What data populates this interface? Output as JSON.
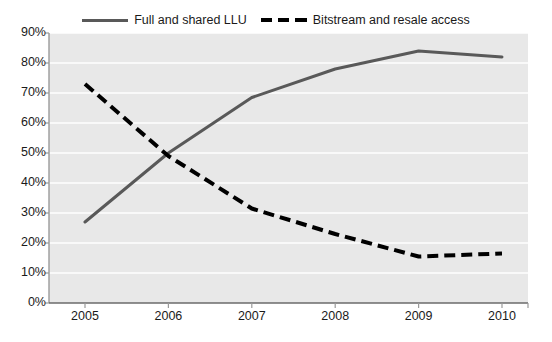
{
  "chart_data": {
    "type": "line",
    "title": "",
    "xlabel": "",
    "ylabel": "",
    "categories": [
      "2005",
      "2006",
      "2007",
      "2008",
      "2009",
      "2010"
    ],
    "x": [
      2005,
      2006,
      2007,
      2008,
      2009,
      2010
    ],
    "ylim": [
      0,
      90
    ],
    "ytick_labels": [
      "0%",
      "10%",
      "20%",
      "30%",
      "40%",
      "50%",
      "60%",
      "70%",
      "80%",
      "90%"
    ],
    "ytick_values": [
      0,
      10,
      20,
      30,
      40,
      50,
      60,
      70,
      80,
      90
    ],
    "grid": "horizontal",
    "legend_position": "top-center",
    "plot_background": "#e8e8e8",
    "series": [
      {
        "name": "Full and shared LLU",
        "values": [
          27,
          50,
          68.5,
          78,
          84,
          82
        ],
        "color": "#595959",
        "style": "solid"
      },
      {
        "name": "Bitstream and resale access",
        "values": [
          73,
          49,
          31.5,
          23,
          15.5,
          16.5
        ],
        "color": "#000000",
        "style": "dashed"
      }
    ]
  },
  "legend": {
    "entries": [
      {
        "label": "Full and shared LLU",
        "swatch": "solid-line-swatch"
      },
      {
        "label": "Bitstream and resale access",
        "swatch": "dashed-line-swatch"
      }
    ]
  },
  "axes": {
    "y_ticks": [
      "90%",
      "80%",
      "70%",
      "60%",
      "50%",
      "40%",
      "30%",
      "20%",
      "10%",
      "0%"
    ],
    "x_ticks": [
      "2005",
      "2006",
      "2007",
      "2008",
      "2009",
      "2010"
    ]
  }
}
